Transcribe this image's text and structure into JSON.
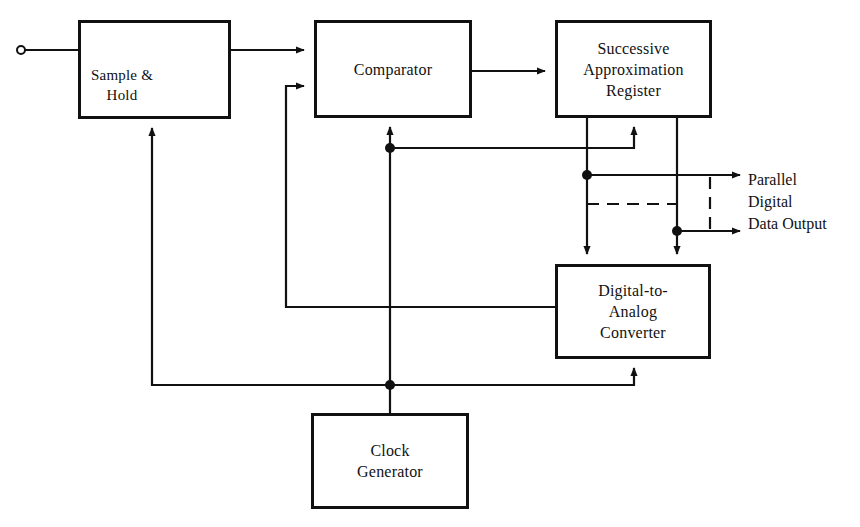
{
  "diagram": {
    "blocks": [
      {
        "id": "sample_hold",
        "lines": [
          "Sample &",
          "Hold"
        ]
      },
      {
        "id": "comparator",
        "lines": [
          "Comparator"
        ]
      },
      {
        "id": "sar",
        "lines": [
          "Successive",
          "Approximation",
          "Register"
        ]
      },
      {
        "id": "dac",
        "lines": [
          "Digital-to-",
          "Analog",
          "Converter"
        ]
      },
      {
        "id": "clock",
        "lines": [
          "Clock",
          "Generator"
        ]
      }
    ],
    "output_label": [
      "Parallel",
      "Digital",
      "Data Output"
    ],
    "icons": {
      "input_terminal": "open-circle",
      "switch": "spst-switch",
      "capacitor": "capacitor-to-ground"
    },
    "connections": [
      {
        "from": "input",
        "to": "sample_hold"
      },
      {
        "from": "sample_hold",
        "to": "comparator"
      },
      {
        "from": "comparator",
        "to": "sar"
      },
      {
        "from": "clock",
        "to": "comparator"
      },
      {
        "from": "clock",
        "to": "sar"
      },
      {
        "from": "clock",
        "to": "sample_hold"
      },
      {
        "from": "clock",
        "to": "dac"
      },
      {
        "from": "sar",
        "to": "dac"
      },
      {
        "from": "sar",
        "to": "parallel_output"
      },
      {
        "from": "dac",
        "to": "comparator"
      }
    ],
    "colors": {
      "line": "#111111",
      "background": "#ffffff"
    }
  }
}
